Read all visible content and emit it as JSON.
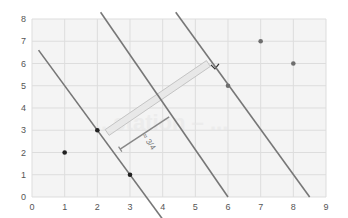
{
  "chart_data": {
    "type": "scatter",
    "title": "",
    "xlabel": "",
    "ylabel": "",
    "xlim": [
      0,
      9
    ],
    "ylim": [
      0,
      8
    ],
    "grid": true,
    "legend": null,
    "x_ticks": [
      "0",
      "1",
      "2",
      "3",
      "4",
      "5",
      "6",
      "7",
      "8",
      "9"
    ],
    "y_ticks": [
      "0",
      "1",
      "2",
      "3",
      "4",
      "5",
      "6",
      "7",
      "8"
    ],
    "series": [
      {
        "name": "class-a",
        "color": "#222222",
        "points": [
          [
            1,
            2
          ],
          [
            2,
            3
          ],
          [
            3,
            1
          ]
        ]
      },
      {
        "name": "class-b",
        "color": "#6e6e6e",
        "points": [
          [
            6,
            5
          ],
          [
            7,
            7
          ],
          [
            8,
            6
          ]
        ]
      }
    ],
    "lines": [
      {
        "name": "lower-margin",
        "equation": "y = -2x + 7",
        "from": [
          0.2,
          6.6
        ],
        "to": [
          4.0,
          -1.0
        ],
        "color": "#777777"
      },
      {
        "name": "decision-boundary",
        "equation": "y = -2x + 12",
        "from": [
          2.1,
          8.3
        ],
        "to": [
          6.0,
          0.0
        ],
        "color": "#777777"
      },
      {
        "name": "upper-margin",
        "equation": "y = -2x + 17",
        "from": [
          4.4,
          8.3
        ],
        "to": [
          8.5,
          0.0
        ],
        "color": "#777777"
      }
    ],
    "annotations": [
      {
        "type": "margin-band",
        "from": [
          2.3,
          2.9
        ],
        "to": [
          5.4,
          6.0
        ],
        "color": "#cccccc"
      },
      {
        "type": "distance-bracket",
        "from": [
          2.7,
          2.15
        ],
        "to": [
          4.2,
          3.6
        ],
        "color": "#888888",
        "label": "≈ 3/4"
      },
      {
        "type": "right-angle-marker",
        "at": [
          5.6,
          5.85
        ]
      }
    ],
    "watermark": "...station – ..."
  }
}
